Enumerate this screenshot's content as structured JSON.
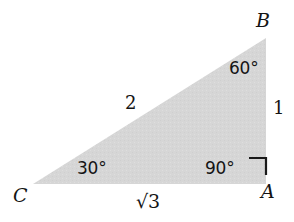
{
  "figure": {
    "type": "geometry-diagram",
    "shape": "right-triangle",
    "background_color": "#ffffff",
    "fill_color": "#d6d6d6",
    "text_color": "#141414"
  },
  "vertices": {
    "a": "A",
    "b": "B",
    "c": "C"
  },
  "angles": {
    "at_b": "60°",
    "at_c": "30°",
    "at_a": "90°"
  },
  "sides": {
    "hypotenuse": "2",
    "vertical": "1",
    "base": "√3"
  },
  "markers": {
    "right_angle": "right-angle-square"
  },
  "geometry": {
    "points": {
      "a": [
        266,
        184
      ],
      "b": [
        266,
        38
      ],
      "c": [
        33,
        184
      ]
    },
    "right_angle_marker": {
      "corner": [
        266,
        175
      ],
      "size": 17
    }
  }
}
